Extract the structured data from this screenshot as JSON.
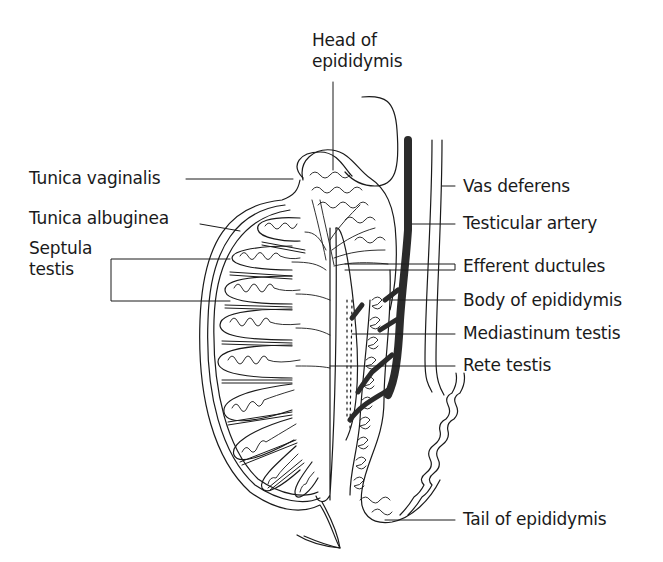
{
  "diagram": {
    "line_color": "#1a1a1a",
    "artery_color": "#2b2b2b",
    "background": "#ffffff",
    "labels": {
      "head_of_epididymis_line1": "Head of",
      "head_of_epididymis_line2": "epididymis",
      "tunica_vaginalis": "Tunica vaginalis",
      "tunica_albuginea": "Tunica albuginea",
      "septula_testis_line1": "Septula",
      "septula_testis_line2": "testis",
      "vas_deferens": "Vas deferens",
      "testicular_artery": "Testicular artery",
      "efferent_ductules": "Efferent ductules",
      "body_of_epididymis": "Body of epididymis",
      "mediastinum_testis": "Mediastinum testis",
      "rete_testis": "Rete testis",
      "tail_of_epididymis": "Tail of epididymis"
    }
  }
}
